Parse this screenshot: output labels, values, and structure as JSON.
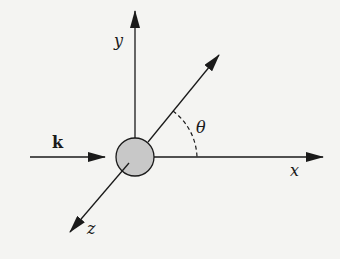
{
  "diagram": {
    "type": "scattering-geometry",
    "labels": {
      "y_axis": "y",
      "x_axis": "x",
      "z_axis": "z",
      "wave_vector": "k",
      "angle": "θ"
    },
    "colors": {
      "line": "#1a1a1a",
      "sphere_fill": "#c8c8c8",
      "background": "#f4f4f2"
    },
    "elements": [
      {
        "name": "y-axis",
        "from": [
          135,
          140
        ],
        "to": [
          135,
          10
        ]
      },
      {
        "name": "x-axis",
        "from": [
          154,
          157
        ],
        "to": [
          323,
          157
        ]
      },
      {
        "name": "z-axis",
        "from": [
          135,
          157
        ],
        "to": [
          70,
          232
        ]
      },
      {
        "name": "scattered-direction",
        "from": [
          148,
          142
        ],
        "to": [
          219,
          55
        ]
      },
      {
        "name": "incident-k-arrow",
        "from": [
          30,
          157
        ],
        "to": [
          105,
          157
        ]
      },
      {
        "name": "scatterer-sphere",
        "center": [
          135,
          157
        ],
        "radius": 19
      },
      {
        "name": "angle-arc",
        "description": "dashed arc between x-axis and scattered direction"
      }
    ]
  }
}
